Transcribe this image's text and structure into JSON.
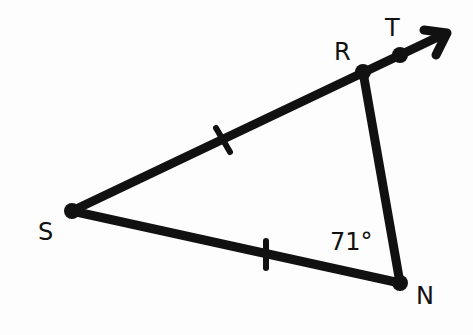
{
  "diagram": {
    "type": "geometry-triangle",
    "colors": {
      "stroke": "#111111",
      "background": "#fdfdfd"
    },
    "points": {
      "S": {
        "label": "S",
        "x": 72,
        "y": 211
      },
      "R": {
        "label": "R",
        "x": 363,
        "y": 72
      },
      "T": {
        "label": "T",
        "x": 400,
        "y": 55
      },
      "N": {
        "label": "N",
        "x": 400,
        "y": 283
      }
    },
    "segments": [
      {
        "from": "S",
        "to": "R",
        "tick_marks": 1
      },
      {
        "from": "S",
        "to": "N",
        "tick_marks": 1
      },
      {
        "from": "R",
        "to": "N",
        "tick_marks": 0
      }
    ],
    "ray": {
      "from": "S",
      "through": "T",
      "arrow": true
    },
    "angles": [
      {
        "vertex": "N",
        "label": "71°",
        "value": 71
      }
    ]
  }
}
